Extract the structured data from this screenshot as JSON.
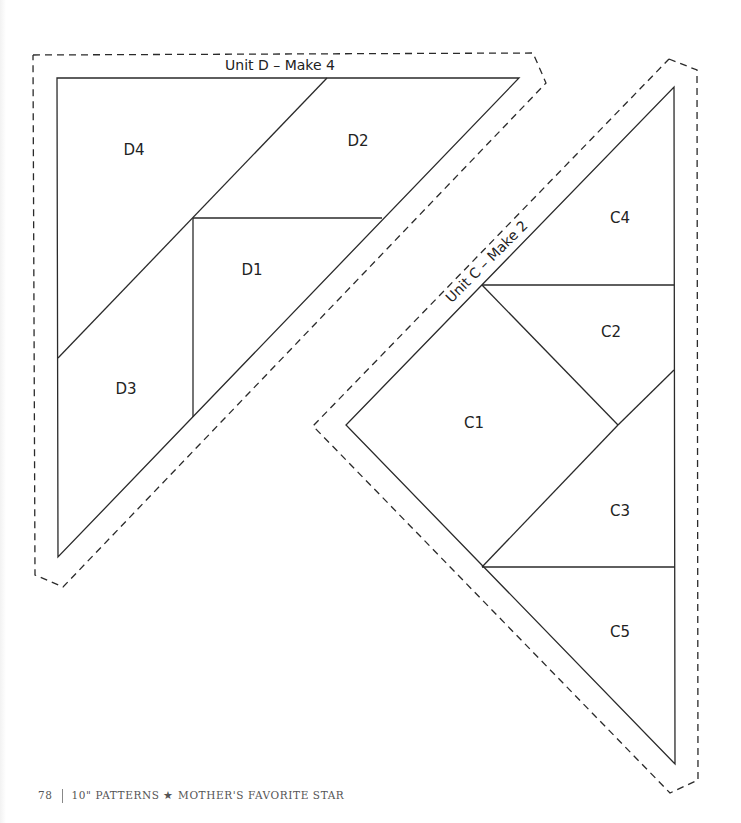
{
  "page": {
    "number": "78",
    "footer_text": "10\" PATTERNS ★ MOTHER'S FAVORITE STAR"
  },
  "units": [
    {
      "id": "D",
      "title": "Unit D – Make 4",
      "pieces": [
        "D1",
        "D2",
        "D3",
        "D4"
      ]
    },
    {
      "id": "C",
      "title": "Unit C – Make 2",
      "pieces": [
        "C1",
        "C2",
        "C3",
        "C4",
        "C5"
      ]
    }
  ],
  "labels": {
    "D1": "D1",
    "D2": "D2",
    "D3": "D3",
    "D4": "D4",
    "C1": "C1",
    "C2": "C2",
    "C3": "C3",
    "C4": "C4",
    "C5": "C5"
  },
  "colors": {
    "line": "#2a2a2a",
    "background": "#ffffff"
  }
}
